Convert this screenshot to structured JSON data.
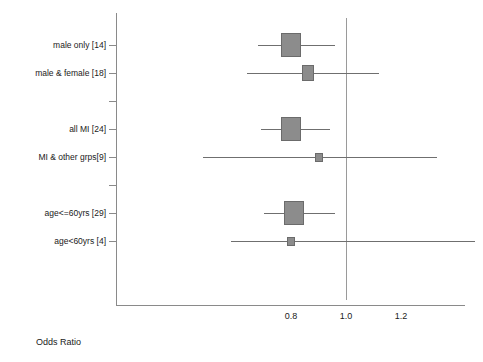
{
  "chart_data": {
    "type": "forest",
    "title": "",
    "xlabel": "Odds Ratio",
    "ylabel": "",
    "xticks": [
      0.8,
      1.0,
      1.2
    ],
    "xtick_labels": [
      "0.8",
      "1.0",
      "1.2"
    ],
    "xlim": [
      0.6,
      1.42
    ],
    "reference_line": 1.0,
    "grid": false,
    "legend": "none",
    "rows": [
      {
        "label": "male only [14]",
        "subgroup_count": 14,
        "estimate": 0.8,
        "ci_low": 0.68,
        "ci_high": 0.96,
        "box_weight": "large",
        "blank": false
      },
      {
        "label": "male & female [18]",
        "subgroup_count": 18,
        "estimate": 0.86,
        "ci_low": 0.64,
        "ci_high": 1.12,
        "box_weight": "medium",
        "blank": false
      },
      {
        "label": "",
        "estimate": null,
        "ci_low": null,
        "ci_high": null,
        "box_weight": "none",
        "blank": true
      },
      {
        "label": "all MI [24]",
        "subgroup_count": 24,
        "estimate": 0.8,
        "ci_low": 0.69,
        "ci_high": 0.94,
        "box_weight": "large",
        "blank": false
      },
      {
        "label": "MI & other grps[9]",
        "subgroup_count": 9,
        "estimate": 0.9,
        "ci_low": 0.48,
        "ci_high": 1.33,
        "box_weight": "small",
        "blank": false
      },
      {
        "label": "",
        "estimate": null,
        "ci_low": null,
        "ci_high": null,
        "box_weight": "none",
        "blank": true
      },
      {
        "label": "age<=60yrs [29]",
        "subgroup_count": 29,
        "estimate": 0.81,
        "ci_low": 0.7,
        "ci_high": 0.96,
        "box_weight": "large",
        "blank": false
      },
      {
        "label": "age<60yrs [4]",
        "subgroup_count": 4,
        "estimate": 0.8,
        "ci_low": 0.58,
        "ci_high": 1.47,
        "box_weight": "small",
        "blank": false
      }
    ]
  }
}
